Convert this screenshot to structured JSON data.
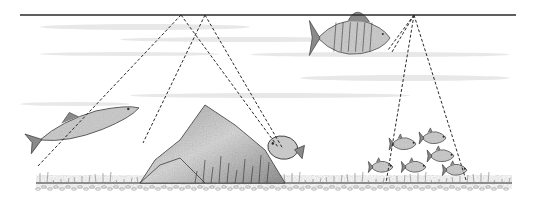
{
  "illustration": {
    "title": "",
    "style": "pencil sketch",
    "colors": {
      "background": "#ffffff",
      "ink": "#2a2a2a",
      "shade": "#8a8a8a",
      "light_shade": "#c8c8c8",
      "water_streak": "#d9d9d9"
    },
    "surface_line": {
      "x1": 20,
      "x2": 516,
      "y": 15
    },
    "bottom_line": {
      "x1": 36,
      "x2": 512,
      "y": 183
    },
    "water_streaks": [
      {
        "x": 40,
        "y": 24,
        "w": 210,
        "h": 6
      },
      {
        "x": 120,
        "y": 37,
        "w": 260,
        "h": 5
      },
      {
        "x": 40,
        "y": 52,
        "w": 180,
        "h": 4
      },
      {
        "x": 250,
        "y": 52,
        "w": 260,
        "h": 5
      },
      {
        "x": 130,
        "y": 93,
        "w": 280,
        "h": 5
      },
      {
        "x": 300,
        "y": 75,
        "w": 210,
        "h": 6
      },
      {
        "x": 20,
        "y": 102,
        "w": 110,
        "h": 4
      }
    ],
    "sonar_beams": [
      {
        "name": "beam-pike",
        "apex": [
          181,
          15
        ],
        "ends": [
          [
            38,
            166
          ],
          [
            278,
            147
          ]
        ]
      },
      {
        "name": "beam-sunfish",
        "apex": [
          205,
          15
        ],
        "ends": [
          [
            143,
            143
          ],
          [
            283,
            149
          ]
        ]
      },
      {
        "name": "beam-perch",
        "apex": [
          414,
          15
        ],
        "ends": [
          [
            388,
            50
          ],
          [
            392,
            52
          ]
        ]
      },
      {
        "name": "beam-school",
        "apex": [
          414,
          15
        ],
        "ends": [
          [
            386,
            183
          ],
          [
            466,
            180
          ]
        ]
      }
    ],
    "rock": {
      "peak": [
        205,
        105
      ],
      "outline": [
        [
          140,
          183
        ],
        [
          155,
          160
        ],
        [
          180,
          140
        ],
        [
          205,
          105
        ],
        [
          235,
          125
        ],
        [
          265,
          150
        ],
        [
          285,
          183
        ]
      ]
    },
    "fish": [
      {
        "kind": "pike",
        "x": 40,
        "y": 140,
        "length": 104,
        "angle": -18
      },
      {
        "kind": "sunfish",
        "x": 268,
        "y": 145,
        "length": 30,
        "angle": 10
      },
      {
        "kind": "perch",
        "x": 318,
        "y": 38,
        "length": 72,
        "angle": 0
      },
      {
        "kind": "minnow",
        "x": 392,
        "y": 144,
        "length": 24,
        "angle": 0
      },
      {
        "kind": "minnow",
        "x": 422,
        "y": 138,
        "length": 24,
        "angle": 0
      },
      {
        "kind": "minnow",
        "x": 430,
        "y": 156,
        "length": 24,
        "angle": 0
      },
      {
        "kind": "minnow",
        "x": 371,
        "y": 167,
        "length": 22,
        "angle": 0
      },
      {
        "kind": "minnow",
        "x": 404,
        "y": 167,
        "length": 22,
        "angle": 0
      },
      {
        "kind": "minnow",
        "x": 445,
        "y": 170,
        "length": 22,
        "angle": 0
      }
    ]
  }
}
